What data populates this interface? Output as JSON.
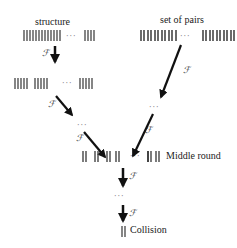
{
  "labels": {
    "structure": "structure",
    "set_of_pairs": "set of pairs",
    "middle_round": "Middle round",
    "collision": "Collision"
  },
  "function_symbol": "ℱ",
  "ellipsis": "···",
  "colors": {
    "background": "#ffffff",
    "ink": "#111111",
    "bar": "#444444",
    "ellipsis": "#888888"
  },
  "rows": {
    "structure_row": {
      "groups": [
        9,
        4
      ]
    },
    "second_row": {
      "groups": [
        5,
        5,
        5
      ]
    },
    "pairs_row": {
      "groups": [
        7,
        6
      ]
    },
    "middle_round_row": {
      "groups": [
        1,
        1,
        1,
        1,
        1,
        1
      ]
    },
    "collision_row": {
      "groups": [
        1
      ]
    }
  }
}
